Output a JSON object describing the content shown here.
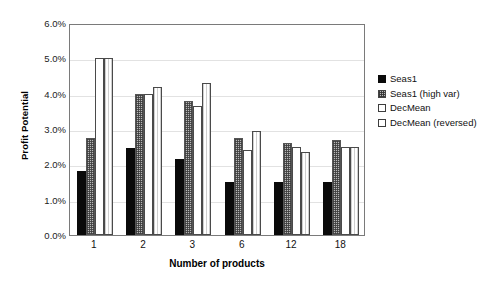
{
  "chart_data": {
    "type": "bar",
    "title": "",
    "xlabel": "Number of products",
    "ylabel": "Profit Potential",
    "categories": [
      "1",
      "2",
      "3",
      "6",
      "12",
      "18"
    ],
    "ylim": [
      0,
      6
    ],
    "yticks": [
      "0.0%",
      "1.0%",
      "2.0%",
      "3.0%",
      "4.0%",
      "5.0%",
      "6.0%"
    ],
    "ytick_values": [
      0,
      1,
      2,
      3,
      4,
      5,
      6
    ],
    "grid": true,
    "legend_position": "right",
    "series": [
      {
        "name": "Seas1",
        "swatch": "solid-black",
        "values": [
          1.8,
          2.45,
          2.15,
          1.5,
          1.5,
          1.5
        ]
      },
      {
        "name": "Seas1 (high var)",
        "swatch": "checker-gray",
        "values": [
          2.75,
          4.0,
          3.8,
          2.75,
          2.6,
          2.7
        ]
      },
      {
        "name": "DecMean",
        "swatch": "white-plain",
        "values": [
          5.0,
          4.0,
          3.65,
          2.4,
          2.5,
          2.5
        ]
      },
      {
        "name": "DecMean (reversed)",
        "swatch": "white-vlines",
        "values": [
          5.0,
          4.2,
          4.3,
          2.95,
          2.35,
          2.5
        ]
      }
    ]
  },
  "colors": {
    "series_0": "#0a0a0a",
    "series_1": "#b9b9b9",
    "series_2": "#ffffff",
    "series_3": "#ffffff",
    "frame": "#7a7a7a",
    "grid": "#e2e2e2",
    "background": "#ffffff"
  }
}
